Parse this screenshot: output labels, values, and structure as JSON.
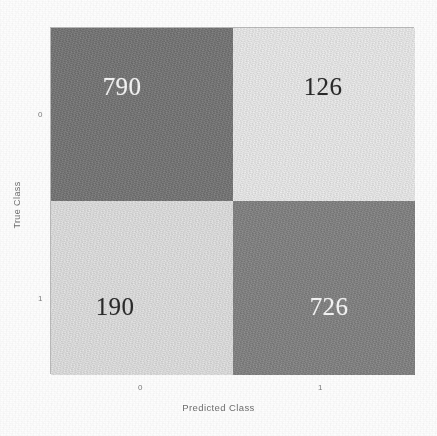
{
  "chart_data": {
    "type": "heatmap",
    "subtype": "confusion-matrix",
    "title": "",
    "xlabel": "Predicted Class",
    "ylabel": "True Class",
    "x_tick_labels": [
      "0",
      "1"
    ],
    "y_tick_labels": [
      "0",
      "1"
    ],
    "categories": [
      "0",
      "1"
    ],
    "grid": false,
    "legend": "none",
    "colormap": "grayscale",
    "matrix": [
      [
        790,
        126
      ],
      [
        190,
        726
      ]
    ],
    "cells": [
      {
        "row": 0,
        "col": 0,
        "true_class": "0",
        "predicted_class": "0",
        "value": "790",
        "fill": "#737373",
        "text_color": "#f4f4f4",
        "kind": "true-negative"
      },
      {
        "row": 0,
        "col": 1,
        "true_class": "0",
        "predicted_class": "1",
        "value": "126",
        "fill": "#ececec",
        "text_color": "#2a2a2a",
        "kind": "false-positive"
      },
      {
        "row": 1,
        "col": 0,
        "true_class": "1",
        "predicted_class": "0",
        "value": "190",
        "fill": "#e1e1e1",
        "text_color": "#2a2a2a",
        "kind": "false-negative"
      },
      {
        "row": 1,
        "col": 1,
        "true_class": "1",
        "predicted_class": "1",
        "value": "726",
        "fill": "#808080",
        "text_color": "#f4f4f4",
        "kind": "true-positive"
      }
    ],
    "colors": {
      "background": "#fdfdfd",
      "axis_line": "#b9b9b9",
      "label_text": "#6f6f6f",
      "tick_text": "#7e7e7e",
      "cell_dark": "#737373",
      "cell_mid": "#808080",
      "cell_light": "#e1e1e1",
      "cell_lightest": "#ececec"
    }
  }
}
